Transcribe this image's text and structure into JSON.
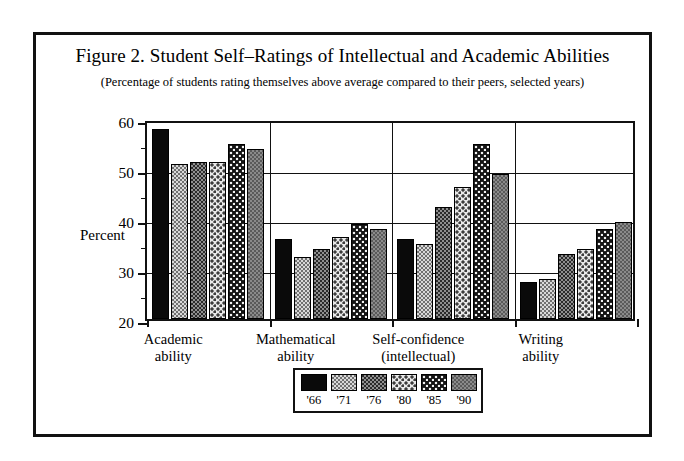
{
  "figure": {
    "title": "Figure 2. Student Self–Ratings of Intellectual and Academic Abilities",
    "subtitle": "(Percentage of students rating themselves above average compared to their peers, selected years)",
    "axis_label": "Percent"
  },
  "chart_data": {
    "type": "bar",
    "title": "Figure 2. Student Self–Ratings of Intellectual and Academic Abilities",
    "subtitle": "(Percentage of students rating themselves above average compared to their peers, selected years)",
    "xlabel": "",
    "ylabel": "Percent",
    "ylim": [
      20,
      60
    ],
    "ytick_labels": [
      "20",
      "30",
      "40",
      "50",
      "60"
    ],
    "ytick_values": [
      20,
      30,
      40,
      50,
      60
    ],
    "yminor_step": 5,
    "grid": true,
    "legend_position": "bottom-center",
    "categories": [
      "Academic\nability",
      "Mathematical\nability",
      "Self-confidence\n(intellectual)",
      "Writing\nability"
    ],
    "category_lines": [
      [
        "Academic",
        "ability"
      ],
      [
        "Mathematical",
        "ability"
      ],
      [
        "Self-confidence",
        "(intellectual)"
      ],
      [
        "Writing",
        "ability"
      ]
    ],
    "series": [
      {
        "name": "'66",
        "pattern": "solid-black",
        "values": [
          58.0,
          36.0,
          36.0,
          27.5
        ]
      },
      {
        "name": "'71",
        "pattern": "light-check",
        "values": [
          51.0,
          32.5,
          35.0,
          28.0
        ]
      },
      {
        "name": "'76",
        "pattern": "dark-check",
        "values": [
          51.5,
          34.0,
          42.5,
          33.0
        ]
      },
      {
        "name": "'80",
        "pattern": "light-dot",
        "values": [
          51.5,
          36.5,
          46.5,
          34.0
        ]
      },
      {
        "name": "'85",
        "pattern": "dark-dot",
        "values": [
          55.0,
          39.0,
          55.0,
          38.0
        ]
      },
      {
        "name": "'90",
        "pattern": "medium-gray",
        "values": [
          54.0,
          38.0,
          49.0,
          39.5
        ]
      }
    ]
  },
  "legend": {
    "entries": [
      {
        "label": "'66"
      },
      {
        "label": "'71"
      },
      {
        "label": "'76"
      },
      {
        "label": "'80"
      },
      {
        "label": "'85"
      },
      {
        "label": "'90"
      }
    ]
  }
}
